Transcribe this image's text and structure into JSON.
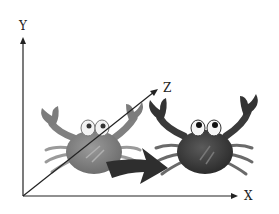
{
  "diagram": {
    "axes": {
      "x_label": "X",
      "y_label": "Y",
      "z_label": "Z"
    },
    "objects": [
      {
        "name": "crab-before",
        "shade": "light",
        "color": "#7a7a7a"
      },
      {
        "name": "crab-after",
        "shade": "dark",
        "color": "#3a3a3a"
      }
    ],
    "arrow": {
      "direction": "translation-along-x",
      "color": "#2e2e2e"
    }
  }
}
